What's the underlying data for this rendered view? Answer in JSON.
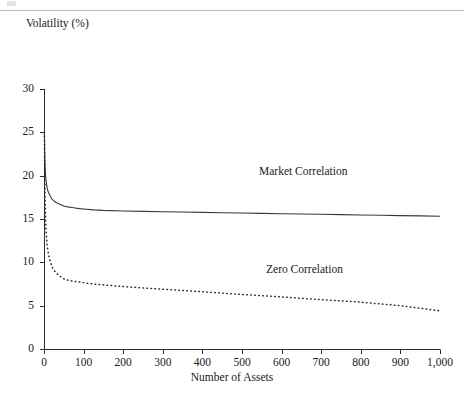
{
  "page": {
    "background_color": "#ffffff",
    "rule_color": "#b9b9b9"
  },
  "chart_data": {
    "type": "line",
    "title": "",
    "xlabel": "Number of Assets",
    "ylabel": "Volatility (%)",
    "xlim": [
      0,
      1000
    ],
    "ylim": [
      0,
      30
    ],
    "grid": false,
    "legend_position": "inline-annotation",
    "axis_color": "#2b2b2b",
    "xticks": [
      0,
      100,
      200,
      300,
      400,
      500,
      600,
      700,
      800,
      900,
      1000
    ],
    "xtick_labels": [
      "0",
      "100",
      "200",
      "300",
      "400",
      "500",
      "600",
      "700",
      "800",
      "900",
      "1,000"
    ],
    "yticks": [
      0,
      5,
      10,
      15,
      20,
      25,
      30
    ],
    "ytick_labels": [
      "0",
      "5",
      "10",
      "15",
      "20",
      "25",
      "30"
    ],
    "series": [
      {
        "name": "Market Correlation",
        "style": "solid",
        "color": "#3a3a3a",
        "annotation": "Market Correlation",
        "x": [
          1,
          2,
          3,
          4,
          5,
          6,
          8,
          10,
          12,
          15,
          20,
          25,
          30,
          40,
          50,
          60,
          70,
          80,
          90,
          100,
          125,
          150,
          200,
          250,
          300,
          350,
          400,
          450,
          500,
          550,
          600,
          650,
          700,
          750,
          800,
          850,
          900,
          950,
          1000
        ],
        "values": [
          25.0,
          22.2,
          20.9,
          20.1,
          19.5,
          19.1,
          18.6,
          18.2,
          18.0,
          17.7,
          17.3,
          17.1,
          16.9,
          16.7,
          16.5,
          16.4,
          16.33,
          16.26,
          16.2,
          16.15,
          16.05,
          15.99,
          15.93,
          15.88,
          15.84,
          15.8,
          15.76,
          15.72,
          15.69,
          15.65,
          15.61,
          15.58,
          15.54,
          15.5,
          15.47,
          15.43,
          15.39,
          15.36,
          15.32
        ]
      },
      {
        "name": "Zero Correlation",
        "style": "dotted",
        "color": "#2b2b2b",
        "annotation": "Zero Correlation",
        "x": [
          1,
          2,
          3,
          4,
          5,
          6,
          8,
          10,
          12,
          15,
          20,
          25,
          30,
          40,
          50,
          60,
          70,
          80,
          90,
          100,
          125,
          150,
          200,
          250,
          300,
          350,
          400,
          450,
          500,
          550,
          600,
          650,
          700,
          750,
          800,
          850,
          900,
          950,
          1000
        ],
        "values": [
          25.0,
          19.3,
          16.6,
          15.0,
          13.9,
          13.1,
          12.0,
          11.3,
          10.8,
          10.2,
          9.5,
          9.1,
          8.8,
          8.4,
          8.1,
          7.95,
          7.85,
          7.78,
          7.72,
          7.65,
          7.5,
          7.4,
          7.2,
          7.05,
          6.9,
          6.75,
          6.6,
          6.45,
          6.3,
          6.15,
          6.0,
          5.85,
          5.7,
          5.55,
          5.4,
          5.2,
          5.0,
          4.7,
          4.4
        ]
      }
    ]
  }
}
